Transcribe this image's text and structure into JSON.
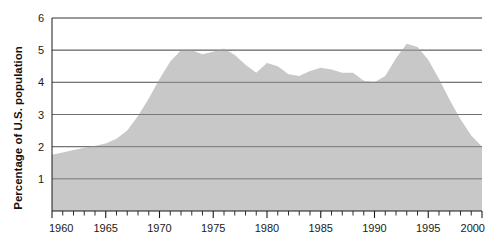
{
  "chart_data": {
    "type": "area",
    "title": "",
    "subtitle": "",
    "xlabel": "",
    "ylabel": "Percentage of U.S. population",
    "xlim": [
      1960,
      2000
    ],
    "ylim": [
      0,
      6
    ],
    "grid": true,
    "legend": null,
    "gridline_values": [
      1,
      2,
      3,
      4,
      5,
      6
    ],
    "y_tick_labels": [
      "1",
      "2",
      "3",
      "4",
      "5",
      "6"
    ],
    "x_tick_labels": [
      "1960",
      "1965",
      "1970",
      "1975",
      "1980",
      "1985",
      "1990",
      "1995",
      "2000"
    ],
    "x_major_ticks": [
      1960,
      1965,
      1970,
      1975,
      1980,
      1985,
      1990,
      1995,
      2000
    ],
    "x_minor_tick_interval": 1,
    "colors": {
      "area_fill": "#c8c8c8",
      "gridline": "#6e6e6e",
      "axis": "#1a1a1a",
      "background": "#ffffff",
      "text": "#1a1a1a"
    },
    "x": [
      1960,
      1961,
      1962,
      1963,
      1964,
      1965,
      1966,
      1967,
      1968,
      1969,
      1970,
      1971,
      1972,
      1973,
      1974,
      1975,
      1976,
      1977,
      1978,
      1979,
      1980,
      1981,
      1982,
      1983,
      1984,
      1985,
      1986,
      1987,
      1988,
      1989,
      1990,
      1991,
      1992,
      1993,
      1994,
      1995,
      1996,
      1997,
      1998,
      1999,
      2000
    ],
    "values": [
      1.75,
      1.82,
      1.9,
      1.97,
      2.03,
      2.1,
      2.25,
      2.5,
      2.95,
      3.5,
      4.1,
      4.65,
      5.0,
      5.0,
      4.87,
      4.95,
      5.05,
      4.85,
      4.55,
      4.3,
      4.6,
      4.5,
      4.25,
      4.2,
      4.35,
      4.45,
      4.4,
      4.3,
      4.3,
      4.05,
      4.0,
      4.2,
      4.75,
      5.2,
      5.1,
      4.7,
      4.1,
      3.45,
      2.85,
      2.35,
      2.0
    ],
    "series": [
      {
        "name": "Percentage of U.S. population",
        "values": [
          1.75,
          1.82,
          1.9,
          1.97,
          2.03,
          2.1,
          2.25,
          2.5,
          2.95,
          3.5,
          4.1,
          4.65,
          5.0,
          5.0,
          4.87,
          4.95,
          5.05,
          4.85,
          4.55,
          4.3,
          4.6,
          4.5,
          4.25,
          4.2,
          4.35,
          4.45,
          4.4,
          4.3,
          4.3,
          4.05,
          4.0,
          4.2,
          4.75,
          5.2,
          5.1,
          4.7,
          4.1,
          3.45,
          2.85,
          2.35,
          2.0
        ]
      }
    ]
  }
}
